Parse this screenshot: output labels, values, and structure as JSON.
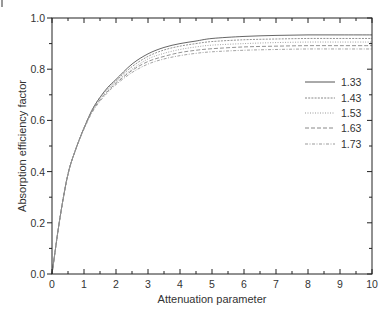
{
  "chart_data": {
    "type": "line",
    "title": "",
    "xlabel": "Attenuation parameter",
    "ylabel": "Absorption efficiency factor",
    "xlim": [
      0,
      10
    ],
    "ylim": [
      0,
      1.0
    ],
    "xticks": [
      "0",
      "1",
      "2",
      "3",
      "4",
      "5",
      "6",
      "7",
      "8",
      "9",
      "10"
    ],
    "yticks": [
      "0.0",
      "0.2",
      "0.4",
      "0.6",
      "0.8",
      "1.0"
    ],
    "grid": false,
    "legend_position": "right-center inside",
    "x": [
      0,
      0.25,
      0.5,
      0.75,
      1,
      1.25,
      1.5,
      1.75,
      2,
      2.5,
      3,
      3.5,
      4,
      4.5,
      5,
      6,
      7,
      8,
      9,
      10
    ],
    "series": [
      {
        "name": "1.33",
        "style": "solid",
        "values": [
          0,
          0.22,
          0.39,
          0.49,
          0.57,
          0.64,
          0.69,
          0.73,
          0.76,
          0.82,
          0.86,
          0.885,
          0.9,
          0.91,
          0.92,
          0.928,
          0.932,
          0.934,
          0.934,
          0.934
        ]
      },
      {
        "name": "1.43",
        "style": "dash-dot-fine",
        "values": [
          0,
          0.22,
          0.39,
          0.49,
          0.57,
          0.64,
          0.69,
          0.725,
          0.755,
          0.81,
          0.85,
          0.875,
          0.89,
          0.9,
          0.908,
          0.915,
          0.918,
          0.92,
          0.92,
          0.92
        ]
      },
      {
        "name": "1.53",
        "style": "dotted",
        "values": [
          0,
          0.22,
          0.39,
          0.49,
          0.57,
          0.635,
          0.685,
          0.72,
          0.75,
          0.8,
          0.84,
          0.862,
          0.877,
          0.887,
          0.894,
          0.9,
          0.904,
          0.906,
          0.906,
          0.906
        ]
      },
      {
        "name": "1.63",
        "style": "dashed",
        "values": [
          0,
          0.22,
          0.39,
          0.49,
          0.57,
          0.635,
          0.68,
          0.715,
          0.745,
          0.795,
          0.83,
          0.85,
          0.865,
          0.874,
          0.88,
          0.887,
          0.89,
          0.892,
          0.892,
          0.892
        ]
      },
      {
        "name": "1.73",
        "style": "dash-dot",
        "values": [
          0,
          0.22,
          0.39,
          0.49,
          0.565,
          0.63,
          0.675,
          0.71,
          0.74,
          0.787,
          0.82,
          0.84,
          0.853,
          0.862,
          0.868,
          0.874,
          0.877,
          0.879,
          0.879,
          0.879
        ]
      }
    ]
  }
}
